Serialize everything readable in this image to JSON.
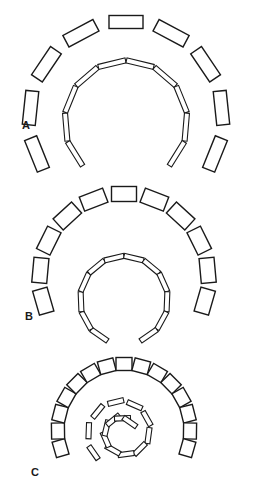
{
  "figure": {
    "background": "#ffffff",
    "stroke_color": "#1a1a1a",
    "panels": [
      {
        "id": "A",
        "label": "A",
        "label_pos": [
          22,
          125
        ],
        "outer_arc": {
          "description": "outer arc of large rectangular blocks",
          "center": [
            126,
            118
          ],
          "radius": 96,
          "start_deg": 202,
          "end_deg": -22,
          "count": 9,
          "block_w": 34,
          "block_h": 13
        },
        "inner_arc": {
          "description": "inner arc of thin slats",
          "center": [
            126,
            122
          ],
          "radius": 60,
          "start_deg": 212,
          "end_deg": -32,
          "count": 10,
          "block_w": 28,
          "block_h": 5
        }
      },
      {
        "id": "B",
        "label": "B",
        "label_pos": [
          25,
          316
        ],
        "outer_arc": {
          "description": "outer arc of medium rectangular blocks",
          "center": [
            124,
            278
          ],
          "radius": 84,
          "start_deg": 196,
          "end_deg": -16,
          "count": 11,
          "block_w": 25,
          "block_h": 15
        },
        "inner_arc": {
          "description": "inner near-circle of thin slats, open at bottom",
          "center": [
            124,
            300
          ],
          "radius": 43,
          "start_deg": 235,
          "end_deg": -55,
          "count": 12,
          "block_w": 20,
          "block_h": 5
        }
      },
      {
        "id": "C",
        "label": "C",
        "label_pos": [
          31,
          472
        ],
        "outer_arc": {
          "description": "outer arc of small near-square blocks",
          "center": [
            124,
            430
          ],
          "radius": 66,
          "start_deg": 196,
          "end_deg": -16,
          "count": 15,
          "block_w": 16,
          "block_h": 13
        },
        "inner_spiral": {
          "description": "inner spiral of thin slats",
          "center": [
            123,
            432
          ],
          "radius_start": 36,
          "radius_end": 12,
          "start_deg": 215,
          "sweep_deg": -520,
          "count": 15,
          "block_w": 16,
          "block_h": 5
        }
      }
    ]
  }
}
